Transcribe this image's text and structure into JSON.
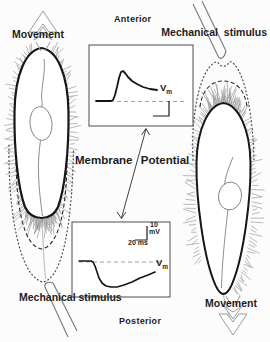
{
  "figure": {
    "anterior": "Anterior",
    "posterior": "Posterior",
    "center_title": "Membrane Potential",
    "colors": {
      "ink": "#1c1c1c",
      "cilia": "#8a8a8a",
      "baseline_dash": "#a0a0a0",
      "background": "#fcfcfc",
      "arrow_outline": "#9a9a9a"
    }
  },
  "left_cell": {
    "movement": "Movement",
    "stimulus": "Mechanical stimulus"
  },
  "right_cell": {
    "stimulus": "Mechanical stimulus",
    "movement": "Movement"
  },
  "traces": {
    "top": {
      "label_base": "V",
      "label_sub": "m",
      "baseline": {
        "x1": 96,
        "x2": 187,
        "y": 101.5
      },
      "points": [
        [
          96,
          101
        ],
        [
          104,
          101
        ],
        [
          111,
          101
        ],
        [
          113,
          100
        ],
        [
          115,
          95
        ],
        [
          117,
          87
        ],
        [
          119,
          78
        ],
        [
          121,
          72
        ],
        [
          123,
          71
        ],
        [
          125,
          73
        ],
        [
          128,
          77
        ],
        [
          132,
          81
        ],
        [
          137,
          84
        ],
        [
          143,
          87
        ],
        [
          150,
          89
        ],
        [
          157,
          90
        ]
      ]
    },
    "bottom": {
      "label_base": "V",
      "label_sub": "m",
      "scale_amplitude": "10",
      "scale_amplitude_unit": "mV",
      "scale_time": "20 ms",
      "baseline": {
        "x1": 79,
        "x2": 161,
        "y": 262
      },
      "points": [
        [
          79,
          261
        ],
        [
          85,
          261
        ],
        [
          91,
          261
        ],
        [
          93,
          262
        ],
        [
          95,
          266
        ],
        [
          97,
          272
        ],
        [
          99,
          278
        ],
        [
          102,
          283
        ],
        [
          106,
          286
        ],
        [
          111,
          287
        ],
        [
          117,
          287
        ],
        [
          124,
          285
        ],
        [
          132,
          282
        ],
        [
          140,
          278
        ],
        [
          148,
          275
        ],
        [
          155,
          272
        ]
      ]
    }
  }
}
